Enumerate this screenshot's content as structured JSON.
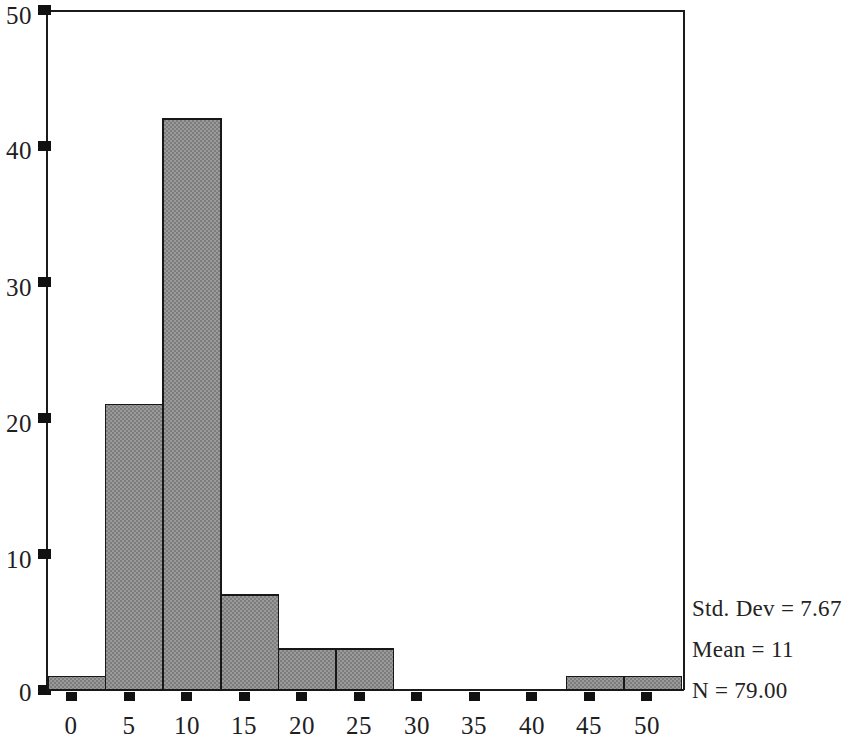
{
  "chart_data": {
    "type": "bar",
    "title": "",
    "subtitle": "",
    "xlabel": "",
    "ylabel": "",
    "xlim": [
      -2,
      53
    ],
    "ylim": [
      0,
      50
    ],
    "grid": false,
    "legend_position": "right-bottom",
    "bin_width": 5,
    "x_ticks": [
      0,
      5,
      10,
      15,
      20,
      25,
      30,
      35,
      40,
      45,
      50
    ],
    "x_tick_labels": [
      "0",
      "5",
      "10",
      "15",
      "20",
      "25",
      "30",
      "35",
      "40",
      "45",
      "50"
    ],
    "y_ticks": [
      0,
      10,
      20,
      30,
      40,
      50
    ],
    "y_tick_labels": [
      "0",
      "10",
      "20",
      "30",
      "40",
      "50"
    ],
    "bars": [
      {
        "bin_start": -2,
        "bin_end": 3,
        "center": 0.5,
        "value": 1
      },
      {
        "bin_start": 3,
        "bin_end": 8,
        "center": 5.5,
        "value": 21
      },
      {
        "bin_start": 8,
        "bin_end": 13,
        "center": 10.5,
        "value": 42
      },
      {
        "bin_start": 13,
        "bin_end": 18,
        "center": 15.5,
        "value": 7
      },
      {
        "bin_start": 18,
        "bin_end": 23,
        "center": 20.5,
        "value": 3
      },
      {
        "bin_start": 23,
        "bin_end": 28,
        "center": 25.5,
        "value": 3
      },
      {
        "bin_start": 43,
        "bin_end": 48,
        "center": 45.5,
        "value": 1
      },
      {
        "bin_start": 48,
        "bin_end": 53,
        "center": 50.5,
        "value": 1
      }
    ],
    "categories": [
      "-2 to 3",
      "3 to 8",
      "8 to 13",
      "13 to 18",
      "18 to 23",
      "23 to 28",
      "43 to 48",
      "48 to 53"
    ],
    "values": [
      1,
      21,
      42,
      7,
      3,
      3,
      1,
      1
    ],
    "annotations": [
      "Std. Dev = 7.67",
      "Mean = 11",
      "N = 79.00"
    ],
    "statistics": {
      "std_dev": "Std. Dev = 7.67",
      "mean": "Mean = 11",
      "n": "N = 79.00"
    },
    "colors": {
      "bar_fill": "#8d8d8d",
      "bar_stroke": "#171717",
      "axis": "#1b1b1b",
      "text": "#20201f",
      "background": "#ffffff"
    }
  }
}
